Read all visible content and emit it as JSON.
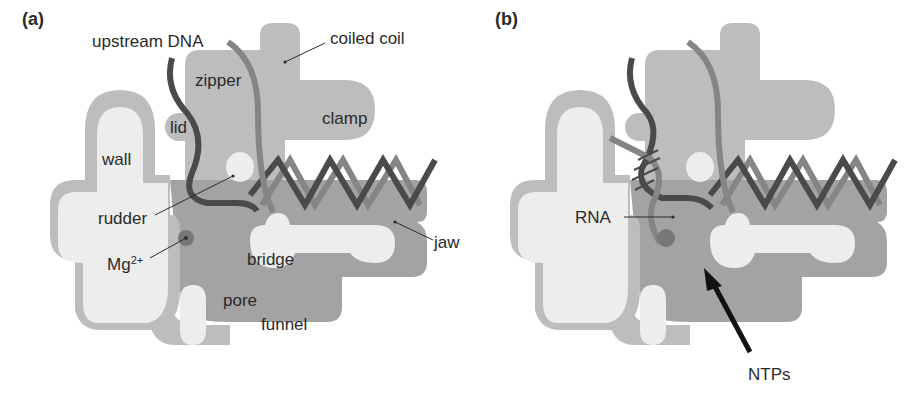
{
  "figure": {
    "panels": [
      {
        "id": "a",
        "label": "(a)",
        "annotations": {
          "upstream_dna": "upstream DNA",
          "coiled_coil": "coiled coil",
          "zipper": "zipper",
          "lid": "lid",
          "clamp": "clamp",
          "wall": "wall",
          "rudder": "rudder",
          "mg": "Mg",
          "mg_sup": "2+",
          "bridge": "bridge",
          "jaw": "jaw",
          "pore": "pore",
          "funnel": "funnel"
        }
      },
      {
        "id": "b",
        "label": "(b)",
        "annotations": {
          "rna": "RNA",
          "ntps": "NTPs"
        }
      }
    ]
  },
  "colors": {
    "outer_gray": "#bdbdbd",
    "mid_gray": "#a3a3a3",
    "light_fill": "#ededed",
    "dna_dark": "#4a4a4a",
    "dna_light": "#858585",
    "mg_dot": "#777777",
    "label_text": "#2a2a2a"
  }
}
